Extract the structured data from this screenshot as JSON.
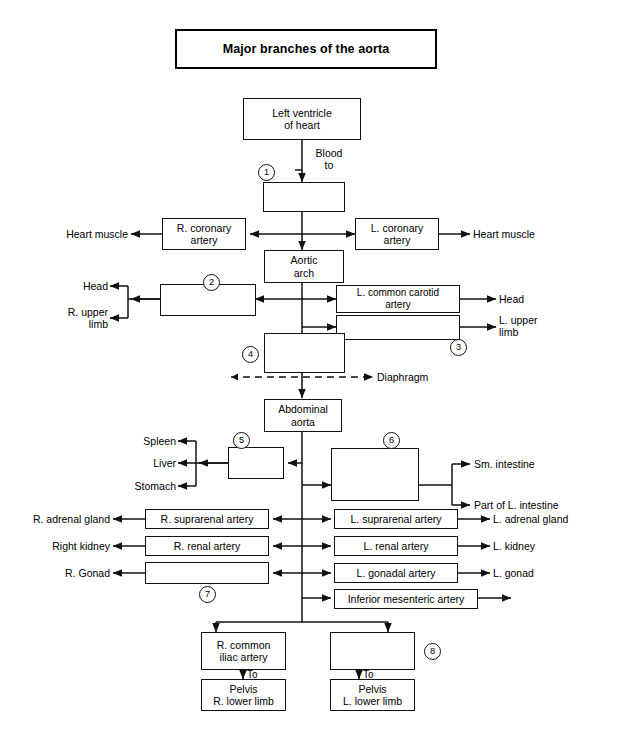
{
  "title": "Major branches of the aorta",
  "boxes": {
    "left_ventricle": "Left ventricle\nof heart",
    "b1": "",
    "aortic_arch": "Aortic\narch",
    "r_coronary": "R. coronary\nartery",
    "l_coronary": "L. coronary\nartery",
    "b2": "",
    "l_common_carotid": "L. common carotid\nartery",
    "b3": "",
    "b4": "",
    "abdominal_aorta": "Abdominal\naorta",
    "b5": "",
    "b6": "",
    "r_suprarenal": "R. suprarenal artery",
    "l_suprarenal": "L. suprarenal artery",
    "r_renal": "R. renal artery",
    "l_renal": "L. renal artery",
    "b7": "",
    "l_gonadal": "L. gonadal artery",
    "inferior_mesenteric": "Inferior mesenteric artery",
    "r_common_iliac": "R. common\niliac artery",
    "b8": "",
    "pelvis_r": "Pelvis\nR. lower limb",
    "pelvis_l": "Pelvis\nL. lower limb"
  },
  "labels": {
    "blood_to": "Blood\nto",
    "heart_muscle_left": "Heart muscle",
    "heart_muscle_right": "Heart muscle",
    "head_left": "Head",
    "r_upper_limb": "R. upper\nlimb",
    "head_right": "Head",
    "l_upper_limb": "L. upper\nlimb",
    "diaphragm": "Diaphragm",
    "spleen": "Spleen",
    "liver": "Liver",
    "stomach": "Stomach",
    "sm_intestine": "Sm. intestine",
    "part_l_intestine_6": "Part of L. intestine",
    "r_adrenal_gland": "R. adrenal gland",
    "l_adrenal_gland": "L. adrenal gland",
    "right_kidney": "Right kidney",
    "l_kidney": "L. kidney",
    "r_gonad": "R. Gonad",
    "l_gonad": "L. gonad",
    "part_l_intestine_imа": "Part of L. intestine",
    "to_left": "To",
    "to_right": "To"
  },
  "numbers": {
    "n1": "1",
    "n2": "2",
    "n3": "3",
    "n4": "4",
    "n5": "5",
    "n6": "6",
    "n7": "7",
    "n8": "8"
  },
  "colors": {
    "stroke": "#111111",
    "background": "#ffffff",
    "text": "#000000"
  }
}
